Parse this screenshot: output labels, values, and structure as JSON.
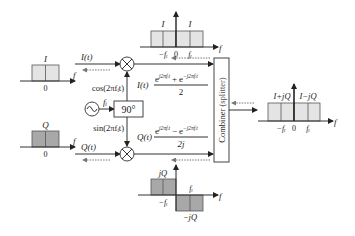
{
  "colors": {
    "spectrum_light": "#e4e4e4",
    "spectrum_dark": "#a8a8a8",
    "line": "#333333",
    "dashed": "#777777"
  },
  "i_baseband": {
    "amp_label": "I",
    "zero_label": "0",
    "axis_label": "f"
  },
  "q_baseband": {
    "amp_label": "Q",
    "zero_label": "0",
    "axis_label": "f"
  },
  "i_path": {
    "signal_label": "I(t)",
    "carrier_label": "cos(2πfᵢt)"
  },
  "q_path": {
    "signal_label": "Q(t)",
    "carrier_label": "sin(2πfᵢt)"
  },
  "oscillator": {
    "freq_label": "fᵢ"
  },
  "phase_shifter": {
    "label": "90°"
  },
  "i_modulated": {
    "prefix": "I(t)",
    "numerator": "e^{j2πfᵢt} + e^{−j2πfᵢt}",
    "num_a": "e",
    "exp_a": "j2πfᵢt",
    "num_op": "+",
    "num_b": "e",
    "exp_b": "−j2πfᵢt",
    "denominator": "2"
  },
  "q_modulated": {
    "prefix": "Q(t)",
    "numerator": "e^{j2πfᵢt} − e^{−j2πfᵢt}",
    "num_a": "e",
    "exp_a": "j2πfᵢt",
    "num_op": "−",
    "num_b": "e",
    "exp_b": "−j2πfᵢt",
    "denominator": "2j"
  },
  "combiner": {
    "label": "Combiner",
    "sublabel": "(splitter)"
  },
  "i_spectrum": {
    "left_amp": "I",
    "right_amp": "I",
    "neg_label": "−fᵢ",
    "zero_label": "0",
    "pos_label": "fᵢ",
    "axis_label": "f"
  },
  "q_spectrum": {
    "pos_amp": "jQ",
    "neg_amp": "−jQ",
    "neg_label": "−fᵢ",
    "pos_label": "fᵢ",
    "axis_label": "f"
  },
  "output_spectrum": {
    "left_amp": "I+jQ",
    "right_amp": "I−jQ",
    "neg_label": "−fᵢ",
    "zero_label": "0",
    "pos_label": "fᵢ",
    "axis_label": "f"
  }
}
